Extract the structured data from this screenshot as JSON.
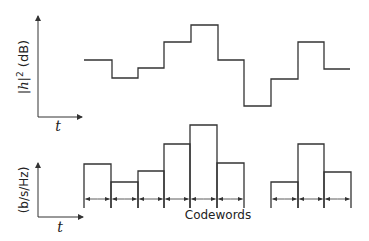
{
  "top_plot": {
    "ylabel": "|h|² (dB)",
    "ylabel_parts": {
      "pre": "|",
      "var": "h",
      "post": "|",
      "sup": "2",
      "unit": " (dB)"
    },
    "xlabel": "t",
    "levels": [
      {
        "x0": 84,
        "x1": 112,
        "y": 60
      },
      {
        "x0": 112,
        "x1": 138,
        "y": 78
      },
      {
        "x0": 138,
        "x1": 164,
        "y": 68
      },
      {
        "x0": 164,
        "x1": 191,
        "y": 42
      },
      {
        "x0": 191,
        "x1": 218,
        "y": 25
      },
      {
        "x0": 218,
        "x1": 244,
        "y": 60
      },
      {
        "x0": 244,
        "x1": 271,
        "y": 106
      },
      {
        "x0": 271,
        "x1": 298,
        "y": 79
      },
      {
        "x0": 298,
        "x1": 324,
        "y": 42
      },
      {
        "x0": 324,
        "x1": 350,
        "y": 69
      }
    ]
  },
  "bottom_plot": {
    "ylabel": "(b/s/Hz)",
    "xlabel": "t",
    "bars": [
      {
        "x0": 84,
        "x1": 111,
        "top": 164
      },
      {
        "x0": 111,
        "x1": 138,
        "top": 182
      },
      {
        "x0": 138,
        "x1": 164,
        "top": 171
      },
      {
        "x0": 164,
        "x1": 190,
        "top": 144
      },
      {
        "x0": 190,
        "x1": 217,
        "top": 125
      },
      {
        "x0": 217,
        "x1": 244,
        "top": 163
      },
      {
        "x0": 271,
        "x1": 298,
        "top": 182
      },
      {
        "x0": 298,
        "x1": 324,
        "top": 144
      },
      {
        "x0": 324,
        "x1": 351,
        "top": 172
      }
    ],
    "bar_bottom": 208,
    "arrow_y": 199,
    "caption": "Codewords"
  },
  "colors": {
    "line": "#333333",
    "background": "#ffffff"
  }
}
